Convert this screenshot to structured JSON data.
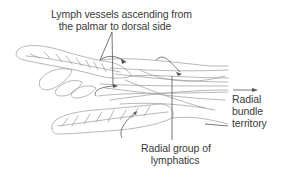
{
  "figure": {
    "line_color": "#9a9a9a",
    "leader_color": "#555555",
    "text_color": "#3a3a3a"
  },
  "labels": {
    "ascending_vessels": {
      "line1": "Lymph vessels ascending from",
      "line2": "the palmar to dorsal side"
    },
    "radial_bundle": {
      "line1": "Radial",
      "line2": "bundle",
      "line3": "territory",
      "arrow": "right-arrow"
    },
    "radial_group": {
      "line1": "Radial group of",
      "line2": "lymphatics"
    }
  }
}
